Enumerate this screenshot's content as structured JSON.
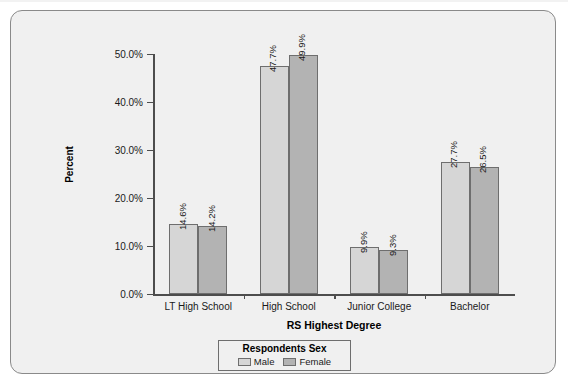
{
  "chart_data": {
    "type": "bar",
    "title": "",
    "subtitle": "",
    "xlabel": "RS Highest Degree",
    "ylabel": "Percent",
    "categories": [
      "LT High School",
      "High School",
      "Junior College",
      "Bachelor"
    ],
    "series": [
      {
        "name": "Male",
        "color": "#d6d6d6",
        "values": [
          14.6,
          47.7,
          9.9,
          27.7
        ],
        "labels": [
          "14.6%",
          "47.7%",
          "9.9%",
          "27.7%"
        ]
      },
      {
        "name": "Female",
        "color": "#b3b3b3",
        "values": [
          14.2,
          49.9,
          9.3,
          26.5
        ],
        "labels": [
          "14.2%",
          "49.9%",
          "9.3%",
          "26.5%"
        ]
      }
    ],
    "ylim": [
      0,
      50
    ],
    "yticks": [
      0,
      10,
      20,
      30,
      40,
      50
    ],
    "ytick_labels": [
      "0.0%",
      "10.0%",
      "20.0%",
      "30.0%",
      "40.0%",
      "50.0%"
    ],
    "grid": false,
    "legend_position": "bottom",
    "legend_title": "Respondents Sex"
  },
  "legend": {
    "title": "Respondents Sex",
    "items": [
      {
        "label": "Male",
        "color": "#d6d6d6"
      },
      {
        "label": "Female",
        "color": "#b3b3b3"
      }
    ]
  },
  "axis": {
    "y_title": "Percent",
    "x_title": "RS Highest Degree"
  },
  "colors": {
    "frame_background": "#f0f0f0",
    "frame_border": "#8a8a8a",
    "axis": "#4d4d4d",
    "bar_male": "#d6d6d6",
    "bar_female": "#b3b3b3",
    "bar_outline": "#6e6e6e",
    "text": "#1a1a1a"
  }
}
